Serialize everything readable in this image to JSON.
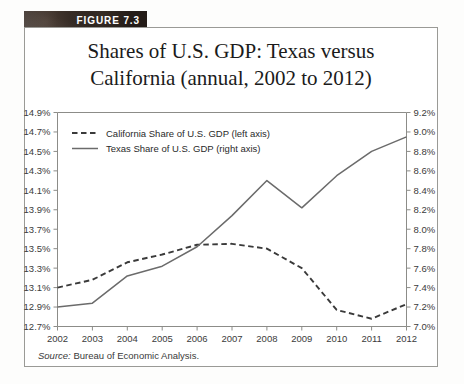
{
  "figure": {
    "banner_label": "FIGURE 7.3",
    "title_line1": "Shares of U.S. GDP: Texas versus",
    "title_line2": "California (annual, 2002 to 2012)",
    "source_prefix": "Source:",
    "source_text": "Bureau of Economic Analysis."
  },
  "chart_data": {
    "type": "line",
    "title": "Shares of U.S. GDP: Texas versus California (annual, 2002 to 2012)",
    "xlabel": "",
    "ylabel": "",
    "grid": false,
    "legend_position": "top-left",
    "categories": [
      "2002",
      "2003",
      "2004",
      "2005",
      "2006",
      "2007",
      "2008",
      "2009",
      "2010",
      "2011",
      "2012"
    ],
    "x": [
      2002,
      2003,
      2004,
      2005,
      2006,
      2007,
      2008,
      2009,
      2010,
      2011,
      2012
    ],
    "left_axis": {
      "label": "California Share of U.S. GDP (left axis)",
      "ylim": [
        12.7,
        14.9
      ],
      "tick_step": 0.2,
      "ticks": [
        "12.7%",
        "12.9%",
        "13.1%",
        "13.3%",
        "13.5%",
        "13.7%",
        "13.9%",
        "14.1%",
        "14.3%",
        "14.5%",
        "14.7%",
        "14.9%"
      ],
      "tick_values": [
        12.7,
        12.9,
        13.1,
        13.3,
        13.5,
        13.7,
        13.9,
        14.1,
        14.3,
        14.5,
        14.7,
        14.9
      ]
    },
    "right_axis": {
      "label": "Texas Share of U.S. GDP (right axis)",
      "ylim": [
        7.0,
        9.2
      ],
      "tick_step": 0.2,
      "ticks": [
        "7.0%",
        "7.2%",
        "7.4%",
        "7.6%",
        "7.8%",
        "8.0%",
        "8.2%",
        "8.4%",
        "8.6%",
        "8.8%",
        "9.0%",
        "9.2%"
      ],
      "tick_values": [
        7.0,
        7.2,
        7.4,
        7.6,
        7.8,
        8.0,
        8.2,
        8.4,
        8.6,
        8.8,
        9.0,
        9.2
      ]
    },
    "series": [
      {
        "name": "California Share of U.S. GDP (left axis)",
        "axis": "left",
        "style": "dashed",
        "color": "#3a3a3a",
        "values": [
          13.1,
          13.18,
          13.36,
          13.44,
          13.54,
          13.55,
          13.5,
          13.3,
          12.87,
          12.78,
          12.93
        ]
      },
      {
        "name": "Texas Share of U.S. GDP (right axis)",
        "axis": "right",
        "style": "solid",
        "color": "#6b6b6b",
        "values": [
          7.2,
          7.24,
          7.52,
          7.62,
          7.82,
          8.14,
          8.5,
          8.22,
          8.55,
          8.8,
          8.95
        ]
      }
    ],
    "legend": [
      {
        "label": "California Share of U.S. GDP (left axis)",
        "style": "dashed"
      },
      {
        "label": "Texas Share of U.S. GDP (right axis)",
        "style": "solid"
      }
    ]
  }
}
